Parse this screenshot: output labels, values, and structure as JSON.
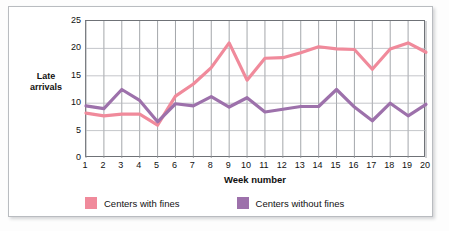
{
  "chart_data": {
    "type": "line",
    "title": "",
    "xlabel": "Week number",
    "ylabel": "Late\narrivals",
    "x": [
      1,
      2,
      3,
      4,
      5,
      6,
      7,
      8,
      9,
      10,
      11,
      12,
      13,
      14,
      15,
      16,
      17,
      18,
      19,
      20
    ],
    "xticklabels": [
      "1",
      "2",
      "3",
      "4",
      "5",
      "6",
      "7",
      "8",
      "9",
      "10",
      "11",
      "12",
      "13",
      "14",
      "15",
      "16",
      "17",
      "18",
      "19",
      "20"
    ],
    "yticklabels": [
      "0",
      "5",
      "10",
      "15",
      "20",
      "25"
    ],
    "yticks": [
      0,
      5,
      10,
      15,
      20,
      25
    ],
    "ylim": [
      0,
      25
    ],
    "xlim": [
      1,
      20
    ],
    "grid": "both",
    "legend_position": "bottom",
    "series": [
      {
        "name": "Centers with fines",
        "color": "#f08a9b",
        "values": [
          8.2,
          7.7,
          8.0,
          8.0,
          6.0,
          11.3,
          13.5,
          16.5,
          21.0,
          14.2,
          18.2,
          18.3,
          19.2,
          20.3,
          19.9,
          19.8,
          16.2,
          19.9,
          21.0,
          19.3
        ]
      },
      {
        "name": "Centers without fines",
        "color": "#9d71ab",
        "values": [
          9.5,
          9.0,
          12.5,
          10.5,
          6.6,
          9.9,
          9.5,
          11.2,
          9.3,
          11.0,
          8.4,
          8.9,
          9.4,
          9.4,
          12.5,
          9.3,
          6.8,
          10.0,
          7.7,
          9.8
        ]
      }
    ]
  },
  "legend": {
    "items": [
      {
        "label": "Centers with fines",
        "color": "#f08a9b"
      },
      {
        "label": "Centers without fines",
        "color": "#9d71ab"
      }
    ]
  }
}
